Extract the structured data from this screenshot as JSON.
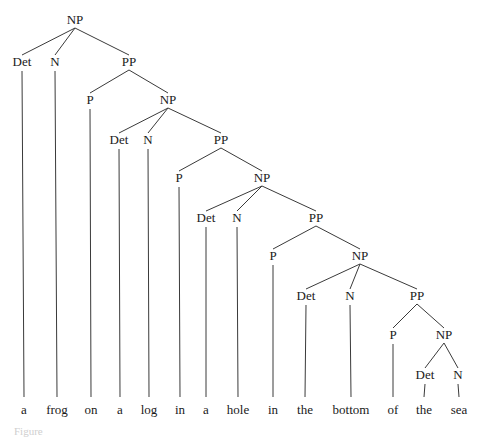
{
  "diagram": {
    "type": "syntax-tree",
    "phrase": "a frog on a log in a hole in the bottom of the sea",
    "caption": "Figure",
    "nodes": [
      {
        "id": "np1",
        "label": "NP",
        "x": 75,
        "y": 24,
        "parent": null
      },
      {
        "id": "det1",
        "label": "Det",
        "x": 22,
        "y": 66,
        "parent": "np1"
      },
      {
        "id": "n1",
        "label": "N",
        "x": 55,
        "y": 66,
        "parent": "np1"
      },
      {
        "id": "pp1",
        "label": "PP",
        "x": 129,
        "y": 66,
        "parent": "np1"
      },
      {
        "id": "p1",
        "label": "P",
        "x": 90,
        "y": 104,
        "parent": "pp1"
      },
      {
        "id": "np2",
        "label": "NP",
        "x": 168,
        "y": 104,
        "parent": "pp1"
      },
      {
        "id": "det2",
        "label": "Det",
        "x": 119,
        "y": 144,
        "parent": "np2"
      },
      {
        "id": "n2",
        "label": "N",
        "x": 148,
        "y": 144,
        "parent": "np2"
      },
      {
        "id": "pp2",
        "label": "PP",
        "x": 221,
        "y": 144,
        "parent": "np2"
      },
      {
        "id": "p2",
        "label": "P",
        "x": 179,
        "y": 182,
        "parent": "pp2"
      },
      {
        "id": "np3",
        "label": "NP",
        "x": 262,
        "y": 182,
        "parent": "pp2"
      },
      {
        "id": "det3",
        "label": "Det",
        "x": 206,
        "y": 222,
        "parent": "np3"
      },
      {
        "id": "n3",
        "label": "N",
        "x": 237,
        "y": 222,
        "parent": "np3"
      },
      {
        "id": "pp3",
        "label": "PP",
        "x": 316,
        "y": 222,
        "parent": "np3"
      },
      {
        "id": "p3",
        "label": "P",
        "x": 273,
        "y": 260,
        "parent": "pp3"
      },
      {
        "id": "np4",
        "label": "NP",
        "x": 360,
        "y": 260,
        "parent": "pp3"
      },
      {
        "id": "det4",
        "label": "Det",
        "x": 306,
        "y": 300,
        "parent": "np4"
      },
      {
        "id": "n4",
        "label": "N",
        "x": 350,
        "y": 300,
        "parent": "np4"
      },
      {
        "id": "pp4",
        "label": "PP",
        "x": 417,
        "y": 300,
        "parent": "np4"
      },
      {
        "id": "p4",
        "label": "P",
        "x": 393,
        "y": 339,
        "parent": "pp4"
      },
      {
        "id": "np5",
        "label": "NP",
        "x": 444,
        "y": 339,
        "parent": "pp4"
      },
      {
        "id": "det5",
        "label": "Det",
        "x": 425,
        "y": 379,
        "parent": "np5"
      },
      {
        "id": "n5",
        "label": "N",
        "x": 458,
        "y": 379,
        "parent": "np5"
      }
    ],
    "words": [
      {
        "text": "a",
        "x": 24,
        "leaf_of": "det1"
      },
      {
        "text": "frog",
        "x": 57,
        "leaf_of": "n1"
      },
      {
        "text": "on",
        "x": 91,
        "leaf_of": "p1"
      },
      {
        "text": "a",
        "x": 120,
        "leaf_of": "det2"
      },
      {
        "text": "log",
        "x": 149,
        "leaf_of": "n2"
      },
      {
        "text": "in",
        "x": 180,
        "leaf_of": "p2"
      },
      {
        "text": "a",
        "x": 206,
        "leaf_of": "det3"
      },
      {
        "text": "hole",
        "x": 238,
        "leaf_of": "n3"
      },
      {
        "text": "in",
        "x": 273,
        "leaf_of": "p3"
      },
      {
        "text": "the",
        "x": 305,
        "leaf_of": "det4"
      },
      {
        "text": "bottom",
        "x": 351,
        "leaf_of": "n4"
      },
      {
        "text": "of",
        "x": 393,
        "leaf_of": "p4"
      },
      {
        "text": "the",
        "x": 424,
        "leaf_of": "det5"
      },
      {
        "text": "sea",
        "x": 459,
        "leaf_of": "n5"
      }
    ],
    "word_baseline_y": 414,
    "leaf_line_bottom_y": 397,
    "colors": {
      "text": "#1a1a1a",
      "lines": "#3a3a3a",
      "background": "#ffffff"
    }
  }
}
